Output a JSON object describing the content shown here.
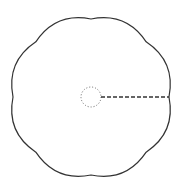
{
  "diagram": {
    "type": "scalloped-shape",
    "lobes": 8,
    "center": [
      91,
      97
    ],
    "cusp_radius": 78,
    "lobe_bulge": 7,
    "outline_color": "#333333",
    "inner_circle": {
      "radius": 10,
      "style": "dotted",
      "color": "#666666"
    },
    "radius_line": {
      "style": "dashed",
      "color": "#333333"
    }
  }
}
